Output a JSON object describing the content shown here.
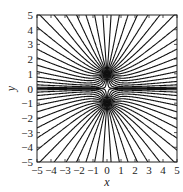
{
  "chart_data": {
    "type": "line",
    "title": "",
    "xlabel": "x",
    "ylabel": "y",
    "xlim": [
      -5,
      5
    ],
    "ylim": [
      -5,
      5
    ],
    "xticks": [
      -5,
      -4,
      -3,
      -2,
      -1,
      0,
      1,
      2,
      3,
      4,
      5
    ],
    "yticks": [
      -5,
      -4,
      -3,
      -2,
      -1,
      0,
      1,
      2,
      3,
      4,
      5
    ],
    "xtick_labels": [
      "−5",
      "−4",
      "−3",
      "−2",
      "−1",
      "0",
      "1",
      "2",
      "3",
      "4",
      "5"
    ],
    "ytick_labels": [
      "−5",
      "−4",
      "−3",
      "−2",
      "−1",
      "0",
      "1",
      "2",
      "3",
      "4",
      "5"
    ],
    "grid": false,
    "legend": null,
    "charges": [
      {
        "x": 0,
        "y": 1,
        "q": 1
      },
      {
        "x": 0,
        "y": -1,
        "q": 1
      }
    ],
    "lines_per_charge": 36,
    "line_color": "#111111"
  },
  "layout": {
    "plot_box": {
      "left": 37,
      "top": 15,
      "right": 177,
      "bottom": 162
    }
  }
}
